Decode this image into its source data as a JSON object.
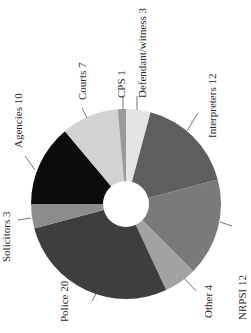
{
  "chart_data": {
    "type": "pie",
    "variant": "donut",
    "rotation_note": "figure rotated 90 degrees; labels read bottom-to-top",
    "categories": [
      "Defendant/witness",
      "Interpreters",
      "NRPSI",
      "Other",
      "Police",
      "Solicitors",
      "Agencies",
      "Courts",
      "CPS"
    ],
    "values": [
      3,
      12,
      12,
      4,
      20,
      3,
      10,
      7,
      1
    ],
    "labels": [
      "Defendant/witness 3",
      "Interpreters 12",
      "NRPSI 12",
      "Other 4",
      "Police 20",
      "Solicitors 3",
      "Agencies 10",
      "Courts 7",
      "CPS 1"
    ],
    "colors": [
      "#e4e4e4",
      "#5e5e5e",
      "#7a7a7a",
      "#a2a2a2",
      "#3e3e3e",
      "#8c8c8c",
      "#0c0c0c",
      "#d2d2d2",
      "#9a9a9a"
    ],
    "title": "",
    "legend": "none (direct labels)",
    "center": [
      126,
      204
    ],
    "outer_radius": 95,
    "inner_radius": 23,
    "start_angle_deg": 0
  },
  "labels_layout": [
    {
      "text": "Defendant/witness 3",
      "x": 146,
      "y": 98,
      "lx1": 137,
      "ly1": 110,
      "lx2": 137,
      "ly2": 96
    },
    {
      "text": "Interpreters 12",
      "x": 216,
      "y": 138,
      "lx1": 187,
      "ly1": 131,
      "lx2": 198,
      "ly2": 113
    },
    {
      "text": "NRPSI 12",
      "x": 246,
      "y": 320,
      "lx1": 220,
      "ly1": 222,
      "lx2": 232,
      "ly2": 226
    },
    {
      "text": "Other 4",
      "x": 212,
      "y": 318,
      "lx1": 184,
      "ly1": 278,
      "lx2": 196,
      "ly2": 291
    },
    {
      "text": "Police 20",
      "x": 68,
      "y": 322,
      "lx1": 99,
      "ly1": 288,
      "lx2": 92,
      "ly2": 301
    },
    {
      "text": "Solicitors 3",
      "x": 10,
      "y": 262,
      "lx1": 31,
      "ly1": 218,
      "lx2": 18,
      "ly2": 220
    },
    {
      "text": "Agencies 10",
      "x": 22,
      "y": 148,
      "lx1": 35,
      "ly1": 170,
      "lx2": 25,
      "ly2": 156
    },
    {
      "text": "Courts 7",
      "x": 86,
      "y": 100,
      "lx1": 87,
      "ly1": 118,
      "lx2": 82,
      "ly2": 108
    },
    {
      "text": "CPS 1",
      "x": 125,
      "y": 98,
      "lx1": 123,
      "ly1": 110,
      "lx2": 123,
      "ly2": 96
    }
  ]
}
